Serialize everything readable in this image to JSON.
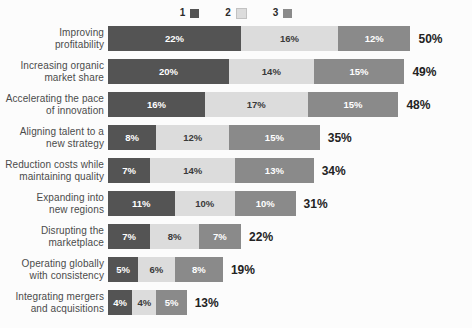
{
  "chart_data": {
    "type": "bar",
    "subtype": "stacked-horizontal",
    "title": "",
    "subtitle": "",
    "xlabel": "",
    "ylabel": "",
    "grid": false,
    "legend_position": "top-center",
    "xlim": [
      0,
      50
    ],
    "unit": "%",
    "categories": [
      "Improving profitability",
      "Increasing organic market share",
      "Accelerating the pace of innovation",
      "Aligning talent to a new strategy",
      "Reduction costs while maintaining quality",
      "Expanding into new regions",
      "Disrupting the marketplace",
      "Operating globally with consistency",
      "Integrating mergers and acquisitions"
    ],
    "series": [
      {
        "name": "1",
        "color": "#545454",
        "values": [
          22,
          20,
          16,
          8,
          7,
          11,
          7,
          5,
          4
        ]
      },
      {
        "name": "2",
        "color": "#dcdcdc",
        "values": [
          16,
          14,
          17,
          12,
          14,
          10,
          8,
          6,
          4
        ]
      },
      {
        "name": "3",
        "color": "#8a8a8a",
        "values": [
          12,
          15,
          15,
          15,
          13,
          10,
          7,
          8,
          5
        ]
      }
    ],
    "totals": [
      50,
      49,
      48,
      35,
      34,
      31,
      22,
      19,
      13
    ]
  },
  "legend": {
    "items": [
      {
        "label": "1",
        "color": "#545454"
      },
      {
        "label": "2",
        "color": "#dcdcdc"
      },
      {
        "label": "3",
        "color": "#8a8a8a"
      }
    ]
  },
  "rows": [
    {
      "label": "Improving\nprofitability",
      "label_lines": [
        "Improving",
        "profitability"
      ],
      "segments": [
        {
          "value": 22,
          "text": "22%"
        },
        {
          "value": 16,
          "text": "16%"
        },
        {
          "value": 12,
          "text": "12%"
        }
      ],
      "total_text": "50%"
    },
    {
      "label": "Increasing organic\nmarket share",
      "label_lines": [
        "Increasing organic",
        "market share"
      ],
      "segments": [
        {
          "value": 20,
          "text": "20%"
        },
        {
          "value": 14,
          "text": "14%"
        },
        {
          "value": 15,
          "text": "15%"
        }
      ],
      "total_text": "49%"
    },
    {
      "label": "Accelerating the pace\nof innovation",
      "label_lines": [
        "Accelerating the pace",
        "of innovation"
      ],
      "segments": [
        {
          "value": 16,
          "text": "16%"
        },
        {
          "value": 17,
          "text": "17%"
        },
        {
          "value": 15,
          "text": "15%"
        }
      ],
      "total_text": "48%"
    },
    {
      "label": "Aligning talent to a\nnew strategy",
      "label_lines": [
        "Aligning talent to a",
        "new strategy"
      ],
      "segments": [
        {
          "value": 8,
          "text": "8%"
        },
        {
          "value": 12,
          "text": "12%"
        },
        {
          "value": 15,
          "text": "15%"
        }
      ],
      "total_text": "35%"
    },
    {
      "label": "Reduction costs while\nmaintaining quality",
      "label_lines": [
        "Reduction costs while",
        "maintaining quality"
      ],
      "segments": [
        {
          "value": 7,
          "text": "7%"
        },
        {
          "value": 14,
          "text": "14%"
        },
        {
          "value": 13,
          "text": "13%"
        }
      ],
      "total_text": "34%"
    },
    {
      "label": "Expanding into\nnew regions",
      "label_lines": [
        "Expanding into",
        "new regions"
      ],
      "segments": [
        {
          "value": 11,
          "text": "11%"
        },
        {
          "value": 10,
          "text": "10%"
        },
        {
          "value": 10,
          "text": "10%"
        }
      ],
      "total_text": "31%"
    },
    {
      "label": "Disrupting the\nmarketplace",
      "label_lines": [
        "Disrupting the",
        "marketplace"
      ],
      "segments": [
        {
          "value": 7,
          "text": "7%"
        },
        {
          "value": 8,
          "text": "8%"
        },
        {
          "value": 7,
          "text": "7%"
        }
      ],
      "total_text": "22%"
    },
    {
      "label": "Operating globally\nwith consistency",
      "label_lines": [
        "Operating globally",
        "with consistency"
      ],
      "segments": [
        {
          "value": 5,
          "text": "5%"
        },
        {
          "value": 6,
          "text": "6%"
        },
        {
          "value": 8,
          "text": "8%"
        }
      ],
      "total_text": "19%"
    },
    {
      "label": "Integrating mergers\nand acquisitions",
      "label_lines": [
        "Integrating mergers",
        "and acquisitions"
      ],
      "segments": [
        {
          "value": 4,
          "text": "4%"
        },
        {
          "value": 4,
          "text": "4%"
        },
        {
          "value": 5,
          "text": "5%"
        }
      ],
      "total_text": "13%"
    }
  ],
  "style": {
    "background": "#fcfcfc",
    "label_color": "#4b4b4b",
    "total_color": "#232323",
    "px_per_percent": 6.05
  }
}
